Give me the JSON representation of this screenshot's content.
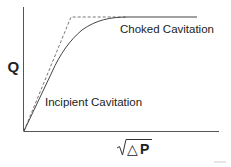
{
  "diagram": {
    "type": "flow-vs-pressure-drop curve",
    "y_axis_label": "Q",
    "x_axis_label": {
      "radical_symbol": "sqrt",
      "delta": "△",
      "variable": "P",
      "full": "√ΔP"
    },
    "annotations": {
      "upper": "Choked Cavitation",
      "lower": "Incipient Cavitation"
    },
    "curves": [
      {
        "name": "actual-flow-curve",
        "style": "solid",
        "description": "Flow rises linearly, then bends and saturates to a plateau"
      },
      {
        "name": "ideal-flow-asymptote",
        "style": "dashed",
        "description": "Linear rise extended to a sharp corner, then horizontal at choked flow"
      }
    ],
    "colors": {
      "axis": "#555555",
      "curve": "#444444",
      "dashed": "#777777",
      "text": "#222222"
    }
  }
}
